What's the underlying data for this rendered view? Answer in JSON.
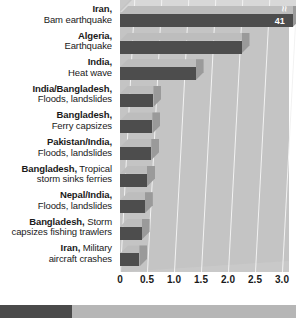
{
  "chart_data": {
    "type": "bar",
    "orientation": "horizontal",
    "title": "",
    "xlabel": "",
    "ylabel": "",
    "xlim": [
      0,
      3.25
    ],
    "grid": true,
    "legend": "none",
    "note": "Top bar is truncated; its true value is shown in the end-of-bar label.",
    "categories": [
      "Iran, Bam earthquake",
      "Algeria, Earthquake",
      "India, Heat wave",
      "India/Bangladesh, Floods, landslides",
      "Bangladesh, Ferry capsizes",
      "Pakistan/India, Floods, landslides",
      "Bangladesh, Tropical storm sinks ferries",
      "Nepal/India, Floods, landslides",
      "Bangladesh, Storm capsizes fishing trawlers",
      "Iran, Military aircraft crashes"
    ],
    "values": [
      3.2,
      2.25,
      1.4,
      0.62,
      0.6,
      0.58,
      0.5,
      0.46,
      0.4,
      0.36
    ],
    "data_labels": [
      "41",
      "",
      "",
      "",
      "",
      "",
      "",
      "",
      "",
      ""
    ],
    "tick_labels": [
      "0",
      "0.5",
      "1.0",
      "1.5",
      "2.0",
      "2.5",
      "3.0"
    ],
    "tick_values": [
      0,
      0.5,
      1.0,
      1.5,
      2.0,
      2.5,
      3.0
    ]
  },
  "rows": [
    {
      "place": "Iran,",
      "desc": "Bam earthquake",
      "inline": false,
      "value": 3.2,
      "label": "41"
    },
    {
      "place": "Algeria,",
      "desc": "Earthquake",
      "inline": false,
      "value": 2.25,
      "label": ""
    },
    {
      "place": "India,",
      "desc": "Heat wave",
      "inline": false,
      "value": 1.4,
      "label": ""
    },
    {
      "place": "India/Bangladesh,",
      "desc": "Floods, landslides",
      "inline": false,
      "value": 0.62,
      "label": ""
    },
    {
      "place": "Bangladesh,",
      "desc": "Ferry capsizes",
      "inline": false,
      "value": 0.6,
      "label": ""
    },
    {
      "place": "Pakistan/India,",
      "desc": "Floods, landslides",
      "inline": false,
      "value": 0.58,
      "label": ""
    },
    {
      "place": "Bangladesh,",
      "desc": "Tropical",
      "desc2": "storm sinks ferries",
      "inline": true,
      "value": 0.5,
      "label": ""
    },
    {
      "place": "Nepal/India,",
      "desc": "Floods, landslides",
      "inline": false,
      "value": 0.46,
      "label": ""
    },
    {
      "place": "Bangladesh,",
      "desc": "Storm",
      "desc2": "capsizes fishing trawlers",
      "inline": true,
      "value": 0.4,
      "label": ""
    },
    {
      "place": "Iran,",
      "desc": "Military",
      "desc2": "aircraft crashes",
      "inline": true,
      "value": 0.36,
      "label": ""
    }
  ],
  "axis": {
    "ticks": [
      "0",
      "0.5",
      "1.0",
      "1.5",
      "2.0",
      "2.5",
      "3.0"
    ]
  },
  "marks": {
    "break_symbol": "≈"
  },
  "footer": {
    "left_text": "",
    "right_text": ""
  },
  "colors": {
    "bar_front": "#4d4d4d",
    "bar_top": "#bdbdbd",
    "bar_side": "#9a9a9a",
    "plot_background": "#c9c9c9",
    "gridline": "#f2f2f2",
    "text": "#1a1a1a"
  }
}
